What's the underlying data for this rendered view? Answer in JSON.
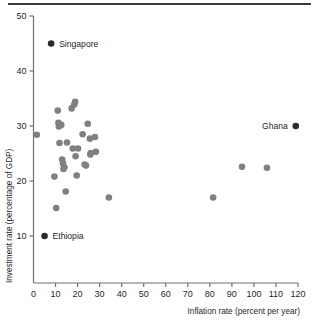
{
  "figure": {
    "has_top_rule": true,
    "background_color": "#ffffff"
  },
  "chart_data": {
    "type": "scatter",
    "title": "",
    "xlabel": "Inflation rate (percent per year)",
    "ylabel": "Investment rate (percentage of GDP)",
    "xlim": [
      0,
      120
    ],
    "ylim": [
      0,
      50
    ],
    "xticks": [
      0,
      10,
      20,
      30,
      40,
      50,
      60,
      70,
      80,
      90,
      100,
      110,
      120
    ],
    "xtick_labels": [
      "0",
      "10",
      "20",
      "30",
      "40",
      "50",
      "60",
      "70",
      "80",
      "90",
      "100",
      "110",
      "120"
    ],
    "yticks": [
      10,
      20,
      30,
      40,
      50
    ],
    "ytick_labels": [
      "10",
      "20",
      "30",
      "40",
      "50"
    ],
    "grid": false,
    "legend": null,
    "series": [
      {
        "name": "countries",
        "marker": "circle",
        "color": "#808080",
        "marker_size": 4.6,
        "points": [
          {
            "x": 1.5,
            "y": 28.4
          },
          {
            "x": 9.5,
            "y": 20.8
          },
          {
            "x": 10.3,
            "y": 15.1
          },
          {
            "x": 11.0,
            "y": 32.8
          },
          {
            "x": 11.3,
            "y": 30.6
          },
          {
            "x": 11.5,
            "y": 29.9
          },
          {
            "x": 11.8,
            "y": 26.9
          },
          {
            "x": 12.6,
            "y": 30.2
          },
          {
            "x": 13.0,
            "y": 23.9
          },
          {
            "x": 13.4,
            "y": 23.2
          },
          {
            "x": 13.6,
            "y": 22.2
          },
          {
            "x": 14.0,
            "y": 22.5
          },
          {
            "x": 14.6,
            "y": 18.1
          },
          {
            "x": 15.2,
            "y": 27.0
          },
          {
            "x": 17.3,
            "y": 33.2
          },
          {
            "x": 17.8,
            "y": 25.9
          },
          {
            "x": 18.5,
            "y": 33.9
          },
          {
            "x": 18.9,
            "y": 34.4
          },
          {
            "x": 19.1,
            "y": 24.5
          },
          {
            "x": 19.6,
            "y": 21.0
          },
          {
            "x": 20.2,
            "y": 25.9
          },
          {
            "x": 22.3,
            "y": 28.5
          },
          {
            "x": 23.2,
            "y": 23.0
          },
          {
            "x": 23.8,
            "y": 22.8
          },
          {
            "x": 24.6,
            "y": 30.4
          },
          {
            "x": 25.6,
            "y": 27.7
          },
          {
            "x": 25.8,
            "y": 24.8
          },
          {
            "x": 26.0,
            "y": 25.1
          },
          {
            "x": 27.9,
            "y": 28.0
          },
          {
            "x": 28.3,
            "y": 25.3
          },
          {
            "x": 34.2,
            "y": 17.0
          },
          {
            "x": 81.5,
            "y": 17.0
          },
          {
            "x": 94.6,
            "y": 22.6
          },
          {
            "x": 105.9,
            "y": 22.4
          }
        ]
      },
      {
        "name": "labeled countries",
        "marker": "circle",
        "color": "#2b2b2b",
        "marker_size": 4.6,
        "points": [
          {
            "x": 8.0,
            "y": 45.0,
            "label": "Singapore",
            "label_side": "right"
          },
          {
            "x": 5.0,
            "y": 10.0,
            "label": "Ethiopia",
            "label_side": "right"
          },
          {
            "x": 119.0,
            "y": 30.0,
            "label": "Ghana",
            "label_side": "left"
          }
        ]
      }
    ]
  }
}
